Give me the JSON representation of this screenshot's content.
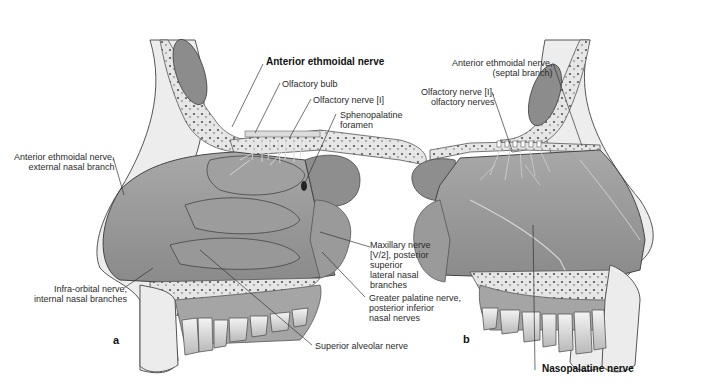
{
  "figure": {
    "type": "anatomical illustration",
    "panels": [
      {
        "id": "a",
        "label": "a",
        "view": "lateral wall of nasal cavity",
        "labels": [
          {
            "text": "Anterior ethmoidal nerve",
            "bold": true
          },
          {
            "text": "Olfactory bulb",
            "bold": false
          },
          {
            "text": "Olfactory nerve [I]",
            "bold": false
          },
          {
            "text": "Sphenopalatine\nforamen",
            "bold": false
          },
          {
            "text": "Anterior ethmoidal nerve,\nexternal nasal branch",
            "bold": false
          },
          {
            "text": "Infra-orbital nerve,\ninternal nasal branches",
            "bold": false
          },
          {
            "text": "Maxillary nerve\n[V/2], posterior\nsuperior\nlateral nasal\nbranches",
            "bold": false
          },
          {
            "text": "Greater palatine nerve,\nposterior inferior\nnasal nerves",
            "bold": false
          },
          {
            "text": "Superior alveolar nerve",
            "bold": false
          }
        ]
      },
      {
        "id": "b",
        "label": "b",
        "view": "nasal septum",
        "labels": [
          {
            "text": "Anterior ethmoidal nerve,\n(septal branch)",
            "bold": false
          },
          {
            "text": "Olfactory nerve [I],\nolfactory nerves",
            "bold": false
          },
          {
            "text": "Nasopalatine nerve",
            "bold": true
          }
        ]
      }
    ]
  },
  "colors": {
    "background": "#ffffff",
    "tissue": "#9a9a9a",
    "tissue_light": "#c8c8c8",
    "bone": "#e4e4e4",
    "skin": "#efefef",
    "text": "#2a2a2a",
    "leader": "#333333"
  }
}
